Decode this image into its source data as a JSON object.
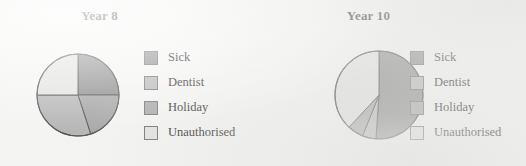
{
  "page": {
    "background_color": "#f4f4f2"
  },
  "palette": {
    "sick": "#8d8d8d",
    "dentist": "#b6b6b6",
    "holiday": "#a6a6a6",
    "unauthorised": "#e2e2e0",
    "outline": "#555555",
    "text": "#1b1b1b"
  },
  "legend": {
    "items": [
      {
        "label": "Sick",
        "color": "#8d8d8d",
        "swatch_name": "legend-swatch-sick"
      },
      {
        "label": "Dentist",
        "color": "#b6b6b6",
        "swatch_name": "legend-swatch-dentist"
      },
      {
        "label": "Holiday",
        "color": "#a6a6a6",
        "swatch_name": "legend-swatch-holiday"
      },
      {
        "label": "Unauthorised",
        "color": "#e2e2e0",
        "swatch_name": "legend-swatch-unauthorised"
      }
    ]
  },
  "chart_data": [
    {
      "type": "pie",
      "title": "Year 8",
      "xlabel": "",
      "ylabel": "",
      "legend_position": "right",
      "grid": false,
      "start_angle_deg": 0,
      "direction": "clockwise",
      "categories": [
        "Sick",
        "Dentist",
        "Holiday",
        "Unauthorised"
      ],
      "values": [
        25,
        30,
        20,
        25
      ],
      "units": "percent",
      "slices": [
        {
          "label": "Sick",
          "value": 25,
          "color": "#8d8d8d",
          "start_deg": 0,
          "end_deg": 90
        },
        {
          "label": "Holiday",
          "value": 20,
          "color": "#a6a6a6",
          "start_deg": 90,
          "end_deg": 162
        },
        {
          "label": "Dentist",
          "value": 30,
          "color": "#b6b6b6",
          "start_deg": 162,
          "end_deg": 270
        },
        {
          "label": "Unauthorised",
          "value": 25,
          "color": "#e2e2e0",
          "start_deg": 270,
          "end_deg": 360
        }
      ]
    },
    {
      "type": "pie",
      "title": "Year 10",
      "xlabel": "",
      "ylabel": "",
      "legend_position": "right",
      "grid": false,
      "start_angle_deg": 0,
      "direction": "clockwise",
      "categories": [
        "Sick",
        "Dentist",
        "Holiday",
        "Unauthorised"
      ],
      "values": [
        51,
        5,
        6,
        38
      ],
      "units": "percent",
      "slices": [
        {
          "label": "Sick",
          "value": 51,
          "color": "#8d8d8d",
          "start_deg": 0,
          "end_deg": 184
        },
        {
          "label": "Dentist",
          "value": 5,
          "color": "#b6b6b6",
          "start_deg": 184,
          "end_deg": 202
        },
        {
          "label": "Holiday",
          "value": 6,
          "color": "#a6a6a6",
          "start_deg": 202,
          "end_deg": 223
        },
        {
          "label": "Unauthorised",
          "value": 38,
          "color": "#e2e2e0",
          "start_deg": 223,
          "end_deg": 360
        }
      ]
    }
  ],
  "charts": {
    "year8": {
      "title": "Year 8",
      "radius": 41,
      "center": {
        "x": 42,
        "y": 43
      }
    },
    "year10": {
      "title": "Year 10",
      "radius": 44,
      "center": {
        "x": 45,
        "y": 46
      }
    }
  }
}
